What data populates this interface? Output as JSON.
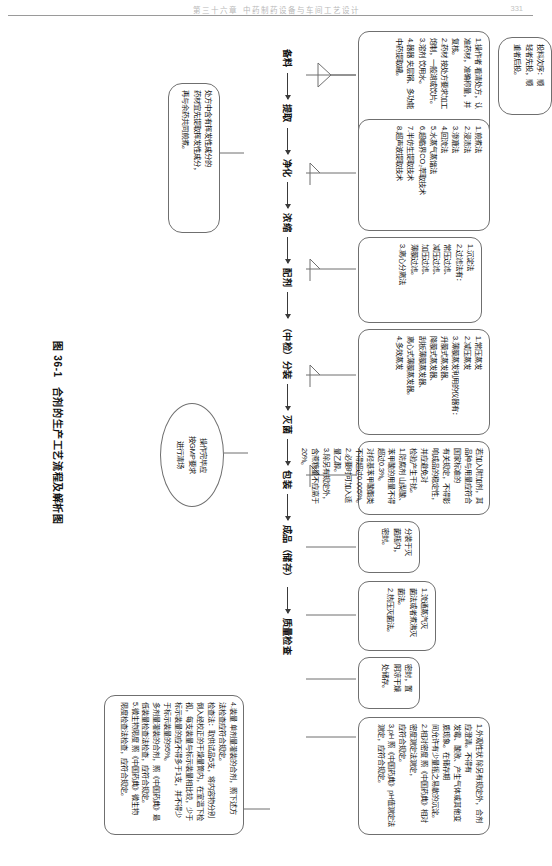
{
  "page": {
    "header_text": "第三十六章 中药制药设备与车间工艺设计",
    "page_number": "331"
  },
  "figure": {
    "caption_number": "图 36-1",
    "caption_title": "合剂的生产工艺流程及解析图"
  },
  "flow": {
    "nodes": [
      "备料",
      "提取",
      "净化",
      "浓缩",
      "配剂",
      "（中检）分装",
      "灭菌",
      "包装",
      "成品（储存）",
      "质量检查"
    ]
  },
  "boxes": {
    "beiliao": {
      "name": "备料",
      "lines": [
        "1.操作者 看清处方，认",
        "准药材，准确称量，并",
        "复核。",
        "2.药材 按处方要求加工",
        "炮制，一般湖或饮片。",
        "3.溶剂 饮用水。",
        "4.器器 夹层锅、多功能",
        "中药提取罐。"
      ]
    },
    "touliao_note": {
      "name": "投料次序",
      "lines": [
        "投料次序：顺",
        "轻者先投，顺",
        "重者后投。"
      ]
    },
    "tiqu": {
      "name": "提取方法",
      "lines": [
        "1.煎煮法",
        "2.浸渍法",
        "3.渗漉法",
        "4.回流法",
        "5.水蒸气蒸馏法",
        "6.超临界CO₂萃取技术",
        "7.半仿生提取技术",
        "8.超声波提取技术"
      ]
    },
    "jinghua": {
      "name": "净化方法",
      "lines": [
        "1.沉淀法",
        "2.过滤法有：",
        "常压过滤、",
        "减压过滤、",
        "加压过滤、",
        "薄膜过滤。",
        "3.离心分离法"
      ]
    },
    "nongsuo": {
      "name": "浓缩方法",
      "lines": [
        "1.常压蒸发",
        "2.减压蒸发",
        "3.薄膜蒸发利用的仪器有：",
        "升膜式蒸发器、",
        "降膜式蒸发器、",
        "刮板薄膜蒸发器、",
        "离心式薄膜蒸发器。",
        "4.多效蒸发"
      ]
    },
    "peiji": {
      "name": "配剂要求",
      "lines": [
        "若加入附加剂，其品种与用量应符合国家标准的",
        "有关规定，不得影响成品的稳定性，并应避免对",
        "检验产生干扰。",
        "1.防腐剂 山梨酸、苯甲酸的用量不得超过0.3%。",
        "对羟基苯甲酸酯类不得超过0.005%。",
        "2.必要时可加入适量乙醇。",
        "3.除另有规定外，含蔗糖量不应高于20%。"
      ]
    },
    "fenzhuang": {
      "name": "分装",
      "lines": [
        "分装于灭",
        "菌瓶内，",
        "密封。"
      ]
    },
    "miejun": {
      "name": "灭菌",
      "lines": [
        "1.流通蒸汽灭",
        "菌法或者煮沸灭",
        "菌法。",
        "2.热压灭菌法。"
      ]
    },
    "baozhuang": {
      "name": "包装储存",
      "lines": [
        "密封，置",
        "阴凉干燥",
        "处储存。"
      ]
    },
    "zhiliang": {
      "name": "质量检查",
      "lines": [
        "1.外观性状 除另有规定外，合剂应澄清。不得有",
        "发霉、酸败、产生气体或其他变质现象。在储存期",
        "间允许有少量摇之易散的沉淀。",
        "2.相对密度 照《中国药典》相对密度测定法测定，",
        "应符合规定。",
        "3.pH 照《中国药典》pH值测定法测定，应符合规定。"
      ]
    },
    "zhiliang2": {
      "name": "质量检查续",
      "lines": [
        "4.装量 单剂量灌装的合剂，照下述方",
        "法检查应符合规定。",
        "检查法：取供试品5支，将内容物分别",
        "倒入经校正的干燥量筒内，在室温下检",
        "视，每支装量与标示装量相比较，少于",
        "标示装量的应不得多于1支，并不得少",
        "于标示装量的95%。",
        "多剂量灌装的合剂，照《中国药典》最",
        "低装量检查法检查，应符合规定。",
        "5.微生物限度 照《中国药典》微生物",
        "限度检查法检查，应符合规定。"
      ]
    }
  },
  "ellipses": {
    "gmp": {
      "name": "操作完毕GMP要求",
      "lines": [
        "操作完毕应",
        "按GMP要求",
        "进行清场"
      ]
    },
    "huifaxing": {
      "name": "挥发性成分提示",
      "lines": [
        "处方中含有挥发性成分的",
        "药材宜先提取挥发性成分，",
        "再与余药共同煎煮。"
      ]
    }
  }
}
